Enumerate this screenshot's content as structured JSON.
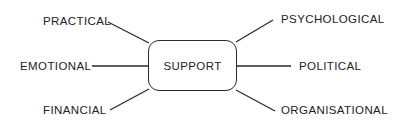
{
  "diagram": {
    "type": "concept-map",
    "center": {
      "label": "SUPPORT"
    },
    "nodes": [
      {
        "id": "practical",
        "label": "PRACTICAL",
        "side": "left",
        "position": "top"
      },
      {
        "id": "emotional",
        "label": "EMOTIONAL",
        "side": "left",
        "position": "middle"
      },
      {
        "id": "financial",
        "label": "FINANCIAL",
        "side": "left",
        "position": "bottom"
      },
      {
        "id": "psychological",
        "label": "PSYCHOLOGICAL",
        "side": "right",
        "position": "top"
      },
      {
        "id": "political",
        "label": "POLITICAL",
        "side": "right",
        "position": "middle"
      },
      {
        "id": "organisational",
        "label": "ORGANISATIONAL",
        "side": "right",
        "position": "bottom"
      }
    ],
    "colors": {
      "line": "#2a2a2a",
      "text": "#222222",
      "background": "#ffffff"
    }
  }
}
